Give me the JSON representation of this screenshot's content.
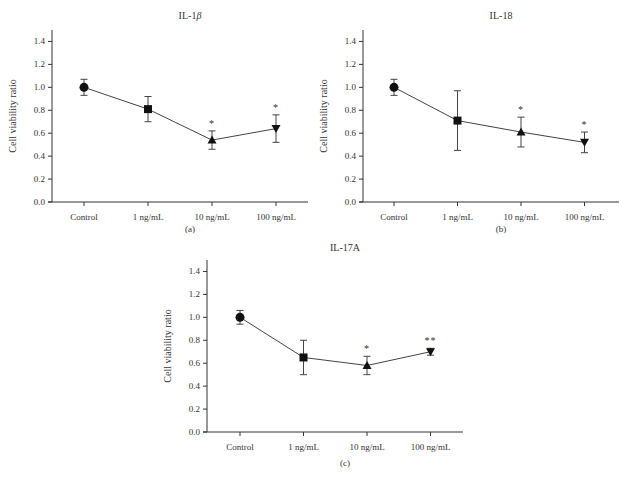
{
  "figure": {
    "panels": [
      {
        "title": "IL-1β",
        "label": "(a)"
      },
      {
        "title": "IL-18",
        "label": "(b)"
      },
      {
        "title": "IL-17A",
        "label": "(c)"
      }
    ]
  },
  "chart_data": [
    {
      "type": "line",
      "title": "IL-1β",
      "panel_label": "(a)",
      "xlabel": "",
      "ylabel": "Cell viability ratio",
      "categories": [
        "Control",
        "1 ng/mL",
        "10 ng/mL",
        "100 ng/mL"
      ],
      "values": [
        1.0,
        0.81,
        0.54,
        0.64
      ],
      "error": [
        0.07,
        0.11,
        0.08,
        0.12
      ],
      "markers": [
        "circle",
        "square",
        "triangle-up",
        "triangle-down"
      ],
      "significance": [
        "",
        "",
        "*",
        "*"
      ],
      "ylim": [
        0.0,
        1.5
      ],
      "yticks": [
        0.0,
        0.2,
        0.4,
        0.6,
        0.8,
        1.0,
        1.2,
        1.4
      ],
      "grid": false,
      "legend": "none"
    },
    {
      "type": "line",
      "title": "IL-18",
      "panel_label": "(b)",
      "xlabel": "",
      "ylabel": "Cell viability ratio",
      "categories": [
        "Control",
        "1 ng/mL",
        "10 ng/mL",
        "100 ng/mL"
      ],
      "values": [
        1.0,
        0.71,
        0.61,
        0.52
      ],
      "error": [
        0.07,
        0.26,
        0.13,
        0.09
      ],
      "markers": [
        "circle",
        "square",
        "triangle-up",
        "triangle-down"
      ],
      "significance": [
        "",
        "",
        "*",
        "*"
      ],
      "ylim": [
        0.0,
        1.5
      ],
      "yticks": [
        0.0,
        0.2,
        0.4,
        0.6,
        0.8,
        1.0,
        1.2,
        1.4
      ],
      "grid": false,
      "legend": "none"
    },
    {
      "type": "line",
      "title": "IL-17A",
      "panel_label": "(c)",
      "xlabel": "",
      "ylabel": "Cell viability ratio",
      "categories": [
        "Control",
        "1 ng/mL",
        "10 ng/mL",
        "100 ng/mL"
      ],
      "values": [
        1.0,
        0.65,
        0.58,
        0.7
      ],
      "error": [
        0.06,
        0.15,
        0.08,
        0.03
      ],
      "markers": [
        "circle",
        "square",
        "triangle-up",
        "triangle-down"
      ],
      "significance": [
        "",
        "",
        "*",
        "**"
      ],
      "ylim": [
        0.0,
        1.5
      ],
      "yticks": [
        0.0,
        0.2,
        0.4,
        0.6,
        0.8,
        1.0,
        1.2,
        1.4
      ],
      "grid": false,
      "legend": "none"
    }
  ]
}
